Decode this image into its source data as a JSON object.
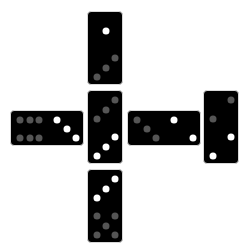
{
  "board": {
    "dominoes": [
      {
        "id": "top",
        "orientation": "v",
        "x": 87,
        "y": 11,
        "a": {
          "value": 1,
          "color": "white"
        },
        "b": {
          "value": 3,
          "color": "gray"
        }
      },
      {
        "id": "left",
        "orientation": "h",
        "x": 10,
        "y": 110,
        "a": {
          "value": 6,
          "color": "gray"
        },
        "b": {
          "value": 3,
          "color": "white"
        }
      },
      {
        "id": "center",
        "orientation": "v",
        "x": 87,
        "y": 90,
        "a": {
          "value": 3,
          "color": "gray"
        },
        "b": {
          "value": 3,
          "color": "white"
        }
      },
      {
        "id": "right",
        "orientation": "h",
        "x": 127,
        "y": 110,
        "a": {
          "value": 3,
          "color": "gray"
        },
        "b": {
          "value": 2,
          "color": "white"
        }
      },
      {
        "id": "far-right",
        "orientation": "v",
        "x": 203,
        "y": 90,
        "a": {
          "value": 2,
          "color": "gray"
        },
        "b": {
          "value": 2,
          "color": "white"
        }
      },
      {
        "id": "bottom",
        "orientation": "v",
        "x": 87,
        "y": 169,
        "a": {
          "value": 3,
          "color": "white"
        },
        "b": {
          "value": 5,
          "color": "gray"
        }
      }
    ]
  },
  "colors": {
    "background": "#ffffff",
    "tile": "#000000",
    "pip_white": "#ffffff",
    "pip_gray": "#555555"
  }
}
